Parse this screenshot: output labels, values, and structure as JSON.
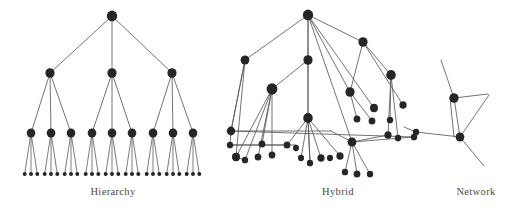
{
  "figure": {
    "width": 516,
    "height": 211,
    "background": "#ffffff",
    "node_color": "#262626",
    "edge_color": "#5a5a5a",
    "label_color": "#4a4a4a"
  },
  "panels": [
    {
      "id": "hierarchy",
      "label": "Hierarchy"
    },
    {
      "id": "hybrid",
      "label": "Hybrid"
    },
    {
      "id": "network",
      "label": "Network"
    }
  ],
  "chart_data": {
    "type": "diagram",
    "title": "",
    "subtitle": "",
    "graphs": [
      {
        "id": "hierarchy",
        "label": "Hierarchy",
        "layout": "tree",
        "levels": 4,
        "branching": [
          3,
          3,
          3
        ],
        "node_counts": {
          "root": 1,
          "level2": 3,
          "level3": 9,
          "leaves": 27
        },
        "node_radius": {
          "root": 5.2,
          "level2": 4.6,
          "level3": 4.3,
          "leaf": 2.0
        },
        "nodes": [
          {
            "id": "h0",
            "x": 112,
            "y": 16,
            "r": 5.2,
            "level": 0
          },
          {
            "id": "h1",
            "x": 50,
            "y": 73,
            "r": 4.6,
            "level": 1
          },
          {
            "id": "h2",
            "x": 112,
            "y": 73,
            "r": 4.6,
            "level": 1
          },
          {
            "id": "h3",
            "x": 172,
            "y": 73,
            "r": 4.6,
            "level": 1
          },
          {
            "id": "h4",
            "x": 31,
            "y": 133,
            "r": 4.3,
            "level": 2
          },
          {
            "id": "h5",
            "x": 51,
            "y": 133,
            "r": 4.3,
            "level": 2
          },
          {
            "id": "h6",
            "x": 71,
            "y": 133,
            "r": 4.3,
            "level": 2
          },
          {
            "id": "h7",
            "x": 92,
            "y": 133,
            "r": 4.3,
            "level": 2
          },
          {
            "id": "h8",
            "x": 112,
            "y": 133,
            "r": 4.3,
            "level": 2
          },
          {
            "id": "h9",
            "x": 132,
            "y": 133,
            "r": 4.3,
            "level": 2
          },
          {
            "id": "h10",
            "x": 153,
            "y": 133,
            "r": 4.3,
            "level": 2
          },
          {
            "id": "h11",
            "x": 173,
            "y": 133,
            "r": 4.3,
            "level": 2
          },
          {
            "id": "h12",
            "x": 193,
            "y": 133,
            "r": 4.3,
            "level": 2
          }
        ],
        "leaf_y": 174,
        "leaf_spread": 7.2,
        "edges": [
          [
            "h0",
            "h1"
          ],
          [
            "h0",
            "h2"
          ],
          [
            "h0",
            "h3"
          ],
          [
            "h1",
            "h4"
          ],
          [
            "h1",
            "h5"
          ],
          [
            "h1",
            "h6"
          ],
          [
            "h2",
            "h7"
          ],
          [
            "h2",
            "h8"
          ],
          [
            "h2",
            "h9"
          ],
          [
            "h3",
            "h10"
          ],
          [
            "h3",
            "h11"
          ],
          [
            "h3",
            "h12"
          ]
        ]
      },
      {
        "id": "hybrid",
        "label": "Hybrid",
        "layout": "hybrid-tree-with-cross-links",
        "node_count": 41,
        "nodes": [
          {
            "id": "y0",
            "x": 308,
            "y": 15,
            "r": 5.2
          },
          {
            "id": "y1",
            "x": 245,
            "y": 60,
            "r": 4.4
          },
          {
            "id": "y2",
            "x": 308,
            "y": 60,
            "r": 4.6
          },
          {
            "id": "y3",
            "x": 363,
            "y": 42,
            "r": 4.6
          },
          {
            "id": "y4",
            "x": 272,
            "y": 89,
            "r": 5.4
          },
          {
            "id": "y5",
            "x": 308,
            "y": 118,
            "r": 4.8
          },
          {
            "id": "y6",
            "x": 350,
            "y": 92,
            "r": 4.6
          },
          {
            "id": "y7",
            "x": 391,
            "y": 75,
            "r": 4.8
          },
          {
            "id": "y8",
            "x": 374,
            "y": 108,
            "r": 4.0
          },
          {
            "id": "y9",
            "x": 357,
            "y": 119,
            "r": 3.4
          },
          {
            "id": "y10",
            "x": 372,
            "y": 121,
            "r": 3.4
          },
          {
            "id": "y11",
            "x": 231,
            "y": 131,
            "r": 4.2
          },
          {
            "id": "y12",
            "x": 230,
            "y": 145,
            "r": 3.2
          },
          {
            "id": "y13",
            "x": 262,
            "y": 144,
            "r": 3.4
          },
          {
            "id": "y14",
            "x": 287,
            "y": 145,
            "r": 3.4
          },
          {
            "id": "y15",
            "x": 296,
            "y": 148,
            "r": 3.0
          },
          {
            "id": "y16",
            "x": 236,
            "y": 157,
            "r": 4.0
          },
          {
            "id": "y17",
            "x": 245,
            "y": 160,
            "r": 3.2
          },
          {
            "id": "y18",
            "x": 258,
            "y": 157,
            "r": 3.4
          },
          {
            "id": "y19",
            "x": 272,
            "y": 155,
            "r": 3.4
          },
          {
            "id": "y20",
            "x": 301,
            "y": 158,
            "r": 3.0
          },
          {
            "id": "y21",
            "x": 310,
            "y": 163,
            "r": 3.2
          },
          {
            "id": "y22",
            "x": 321,
            "y": 158,
            "r": 3.6
          },
          {
            "id": "y23",
            "x": 330,
            "y": 158,
            "r": 3.0
          },
          {
            "id": "y24",
            "x": 340,
            "y": 156,
            "r": 3.6
          },
          {
            "id": "y25",
            "x": 352,
            "y": 142,
            "r": 4.4
          },
          {
            "id": "y26",
            "x": 345,
            "y": 172,
            "r": 3.2
          },
          {
            "id": "y27",
            "x": 357,
            "y": 174,
            "r": 3.4
          },
          {
            "id": "y28",
            "x": 370,
            "y": 174,
            "r": 3.2
          },
          {
            "id": "y29",
            "x": 388,
            "y": 135,
            "r": 3.6
          },
          {
            "id": "y30",
            "x": 398,
            "y": 138,
            "r": 3.2
          },
          {
            "id": "y31",
            "x": 414,
            "y": 137,
            "r": 3.2
          },
          {
            "id": "y32",
            "x": 403,
            "y": 105,
            "r": 3.6
          },
          {
            "id": "y33",
            "x": 390,
            "y": 120,
            "r": 3.2
          }
        ],
        "edges": [
          [
            "y0",
            "y1"
          ],
          [
            "y0",
            "y2"
          ],
          [
            "y0",
            "y3"
          ],
          [
            "y0",
            "y5"
          ],
          [
            "y0",
            "y6"
          ],
          [
            "y0",
            "y8"
          ],
          [
            "y0",
            "y25"
          ],
          [
            "y1",
            "y11"
          ],
          [
            "y1",
            "y16"
          ],
          [
            "y2",
            "y4"
          ],
          [
            "y2",
            "y5"
          ],
          [
            "y3",
            "y6"
          ],
          [
            "y3",
            "y7"
          ],
          [
            "y3",
            "y32"
          ],
          [
            "y4",
            "y13"
          ],
          [
            "y4",
            "y18"
          ],
          [
            "y4",
            "y19"
          ],
          [
            "y5",
            "y21"
          ],
          [
            "y5",
            "y22"
          ],
          [
            "y5",
            "y24"
          ],
          [
            "y5",
            "y14"
          ],
          [
            "y6",
            "y9"
          ],
          [
            "y6",
            "y10"
          ],
          [
            "y7",
            "y29"
          ],
          [
            "y7",
            "y30"
          ],
          [
            "y7",
            "y33"
          ],
          [
            "y11",
            "y12"
          ],
          [
            "y11",
            "y31"
          ],
          [
            "y12",
            "y14"
          ],
          [
            "y16",
            "y17"
          ],
          [
            "y25",
            "y26"
          ],
          [
            "y25",
            "y27"
          ],
          [
            "y25",
            "y28"
          ],
          [
            "y25",
            "y29"
          ]
        ]
      },
      {
        "id": "network",
        "label": "Network",
        "layout": "sparse-network",
        "node_count": 3,
        "nodes": [
          {
            "id": "n0",
            "x": 454,
            "y": 98,
            "r": 4.6
          },
          {
            "id": "n1",
            "x": 460,
            "y": 137,
            "r": 4.4
          },
          {
            "id": "n2",
            "x": 416,
            "y": 132,
            "r": 3.2
          }
        ],
        "edges": [
          [
            "n0",
            "n1"
          ],
          [
            "n0",
            "n1-alt"
          ],
          [
            "n0",
            "stub-up"
          ],
          [
            "n0",
            "stub-right"
          ],
          [
            "n1",
            "stub-upright"
          ],
          [
            "n1",
            "stub-downright"
          ],
          [
            "n1",
            "n2"
          ]
        ],
        "open_endpoints": [
          {
            "from": "n0",
            "x": 441,
            "y": 60
          },
          {
            "from": "n0",
            "x": 488,
            "y": 94
          },
          {
            "from": "n1",
            "x": 489,
            "y": 95
          },
          {
            "from": "n1",
            "x": 484,
            "y": 166
          },
          {
            "from": "n2",
            "x": 404,
            "y": 127
          }
        ]
      }
    ]
  }
}
